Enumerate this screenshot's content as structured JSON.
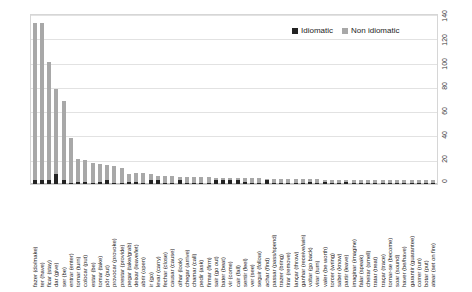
{
  "legend": {
    "position": "top-right",
    "items": [
      {
        "label": "Idiomatic",
        "color": "#232323"
      },
      {
        "label": "Non idiomatic",
        "color": "#a8a8a8"
      }
    ]
  },
  "axis": {
    "y_position": "right",
    "y_ticks": [
      "0",
      "20",
      "40",
      "60",
      "80",
      "100",
      "120",
      "140"
    ]
  },
  "chart_data": {
    "type": "bar",
    "subtype": "stacked-vertical",
    "title": "",
    "subtitle": "",
    "xlabel": "",
    "ylabel": "",
    "ylim": [
      0,
      140
    ],
    "grid": true,
    "legend_position": "top-right",
    "legend": [
      "Idiomatic",
      "Non idiomatic"
    ],
    "categories": [
      "fazer (do/make)",
      "ter (have)",
      "ficar (stay)",
      "dar (give)",
      "ser (be)",
      "entrar (enter)",
      "tornar (turn)",
      "colocar (put)",
      "estar (be)",
      "tomar (take)",
      "pôr (put)",
      "provocar (provoke)",
      "prestar (provide)",
      "pegar (take/grab)",
      "deixar (leave/let)",
      "abrir (open)",
      "ir (go)",
      "levar (carry)",
      "fechar (close)",
      "causar (cause)",
      "olhar (look)",
      "chegar (arrive)",
      "chamar (call)",
      "pedir (ask)",
      "firmar (firm)",
      "sair (go out)",
      "bater (beat)",
      "vir (come)",
      "cair (fall)",
      "sentir (feel)",
      "ver (see)",
      "seguir (follow)",
      "achar (find)",
      "passar (pass/spend)",
      "trazer (bring)",
      "tirar (remove)",
      "lançar (throw)",
      "ganhar (receive/win)",
      "voltar (go back)",
      "virar (turn)",
      "valer (be worth)",
      "torcer (wring)",
      "saber (know)",
      "partir (leave)",
      "imaginar (imagine)",
      "falar (speak)",
      "cheirar (smell)",
      "tratar (treat)",
      "traçar (trace)",
      "tornar-se (become)",
      "soar (sound)",
      "haver (be/have)",
      "garantir (guarantee)",
      "correr (run)",
      "botar (put)",
      "atear (set on fire)"
    ],
    "series": [
      {
        "name": "Idiomatic",
        "color": "#232323",
        "values": [
          3,
          3,
          3,
          8,
          3,
          1,
          2,
          2,
          1,
          2,
          3,
          1,
          1,
          2,
          2,
          1,
          3,
          3,
          1,
          1,
          3,
          1,
          1,
          1,
          1,
          3,
          3,
          3,
          3,
          2,
          1,
          1,
          3,
          1,
          1,
          1,
          1,
          1,
          2,
          1,
          2,
          1,
          1,
          2,
          1,
          1,
          1,
          1,
          1,
          1,
          1,
          1,
          1,
          1,
          1,
          1
        ]
      },
      {
        "name": "Non idiomatic",
        "color": "#a8a8a8",
        "values": [
          130,
          130,
          98,
          71,
          66,
          37,
          19,
          18,
          16,
          15,
          13,
          14,
          12,
          6,
          7,
          8,
          5,
          4,
          6,
          6,
          3,
          5,
          5,
          5,
          5,
          2,
          2,
          2,
          2,
          3,
          4,
          4,
          1,
          3,
          3,
          3,
          3,
          3,
          2,
          3,
          1,
          2,
          2,
          1,
          2,
          2,
          2,
          2,
          2,
          2,
          2,
          2,
          2,
          2,
          2,
          2
        ]
      }
    ],
    "totals": [
      133,
      133,
      101,
      79,
      69,
      38,
      21,
      20,
      17,
      17,
      16,
      15,
      13,
      8,
      9,
      9,
      8,
      7,
      7,
      7,
      6,
      6,
      6,
      6,
      6,
      5,
      5,
      5,
      5,
      5,
      5,
      5,
      4,
      4,
      4,
      4,
      4,
      4,
      4,
      4,
      3,
      3,
      3,
      3,
      3,
      3,
      3,
      3,
      3,
      3,
      3,
      3,
      3,
      3,
      3,
      3
    ]
  }
}
